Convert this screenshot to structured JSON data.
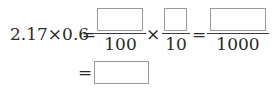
{
  "equation": {
    "lhs": "2.17×0.6",
    "eq1": "=",
    "frac1": {
      "numerator": "",
      "denominator": "100"
    },
    "times": "×",
    "frac2": {
      "numerator": "",
      "denominator": "10"
    },
    "eq2": "=",
    "frac3": {
      "numerator": "",
      "denominator": "1000"
    },
    "eq3": "=",
    "answer": ""
  }
}
